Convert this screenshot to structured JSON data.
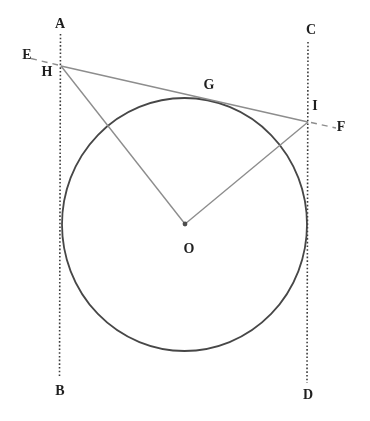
{
  "diagram": {
    "type": "geometry-figure",
    "background": "#ffffff",
    "colors": {
      "dark_line": "#3d3d3d",
      "circle_line": "#474747",
      "light_line": "#8d8d8d",
      "label_text": "#1f1f1f",
      "center_dot": "#4d4d4d"
    },
    "labels": {
      "A": "A",
      "B": "B",
      "C": "C",
      "D": "D",
      "E": "E",
      "F": "F",
      "G": "G",
      "H": "H",
      "I": "I",
      "O": "O"
    },
    "elements": [
      "vertical line A-B (dotted) tangent to circle on left",
      "vertical line C-D (dotted) tangent to circle on right",
      "circle with center O and center dot",
      "tangent line through H, G, I with dashed extensions to E and F",
      "segment O-H",
      "segment O-I"
    ]
  }
}
